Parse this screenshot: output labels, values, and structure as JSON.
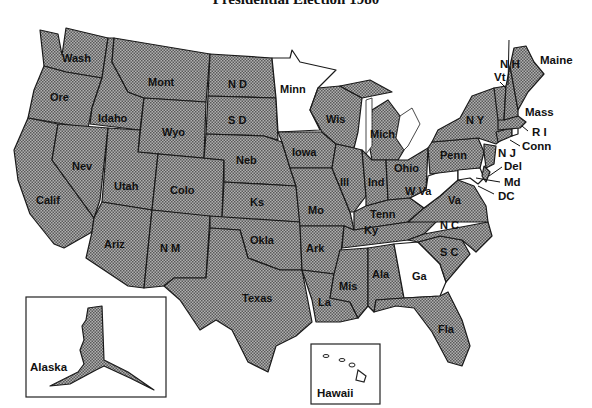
{
  "title": "Presidential Election 1980",
  "colors": {
    "reagan_fill": "#8a8a8a",
    "carter_fill": "#ffffff",
    "border": "#1a1a1a",
    "background": "#ffffff"
  },
  "legend_semantics": {
    "shaded": "Reagan",
    "white": "Carter"
  },
  "states": [
    {
      "abbr": "Wash",
      "won": "shaded"
    },
    {
      "abbr": "Ore",
      "won": "shaded"
    },
    {
      "abbr": "Calif",
      "won": "shaded"
    },
    {
      "abbr": "Idaho",
      "won": "shaded"
    },
    {
      "abbr": "Nev",
      "won": "shaded"
    },
    {
      "abbr": "Mont",
      "won": "shaded"
    },
    {
      "abbr": "Wyo",
      "won": "shaded"
    },
    {
      "abbr": "Utah",
      "won": "shaded"
    },
    {
      "abbr": "Colo",
      "won": "shaded"
    },
    {
      "abbr": "Ariz",
      "won": "shaded"
    },
    {
      "abbr": "N M",
      "won": "shaded"
    },
    {
      "abbr": "N D",
      "won": "shaded"
    },
    {
      "abbr": "S D",
      "won": "shaded"
    },
    {
      "abbr": "Neb",
      "won": "shaded"
    },
    {
      "abbr": "Ks",
      "won": "shaded"
    },
    {
      "abbr": "Okla",
      "won": "shaded"
    },
    {
      "abbr": "Texas",
      "won": "shaded"
    },
    {
      "abbr": "Minn",
      "won": "white"
    },
    {
      "abbr": "Iowa",
      "won": "shaded"
    },
    {
      "abbr": "Mo",
      "won": "shaded"
    },
    {
      "abbr": "Ark",
      "won": "shaded"
    },
    {
      "abbr": "La",
      "won": "shaded"
    },
    {
      "abbr": "Wis",
      "won": "shaded"
    },
    {
      "abbr": "Ill",
      "won": "shaded"
    },
    {
      "abbr": "Mich",
      "won": "shaded"
    },
    {
      "abbr": "Ind",
      "won": "shaded"
    },
    {
      "abbr": "Ohio",
      "won": "shaded"
    },
    {
      "abbr": "Ky",
      "won": "shaded"
    },
    {
      "abbr": "Tenn",
      "won": "shaded"
    },
    {
      "abbr": "Mis",
      "won": "shaded"
    },
    {
      "abbr": "Ala",
      "won": "shaded"
    },
    {
      "abbr": "Ga",
      "won": "white"
    },
    {
      "abbr": "Fla",
      "won": "shaded"
    },
    {
      "abbr": "S C",
      "won": "shaded"
    },
    {
      "abbr": "N C",
      "won": "shaded"
    },
    {
      "abbr": "Va",
      "won": "shaded"
    },
    {
      "abbr": "W Va",
      "won": "white"
    },
    {
      "abbr": "Penn",
      "won": "shaded"
    },
    {
      "abbr": "N Y",
      "won": "shaded"
    },
    {
      "abbr": "Vt",
      "won": "shaded"
    },
    {
      "abbr": "N H",
      "won": "shaded"
    },
    {
      "abbr": "Maine",
      "won": "shaded"
    },
    {
      "abbr": "Mass",
      "won": "shaded"
    },
    {
      "abbr": "R I",
      "won": "white"
    },
    {
      "abbr": "Conn",
      "won": "shaded"
    },
    {
      "abbr": "N J",
      "won": "shaded"
    },
    {
      "abbr": "Del",
      "won": "shaded"
    },
    {
      "abbr": "Md",
      "won": "white"
    },
    {
      "abbr": "DC",
      "won": "white"
    },
    {
      "abbr": "Alaska",
      "won": "shaded"
    },
    {
      "abbr": "Hawaii",
      "won": "white"
    }
  ],
  "labels": {
    "wash": "Wash",
    "ore": "Ore",
    "calif": "Calif",
    "idaho": "Idaho",
    "nev": "Nev",
    "mont": "Mont",
    "wyo": "Wyo",
    "utah": "Utah",
    "colo": "Colo",
    "ariz": "Ariz",
    "nm": "N M",
    "nd": "N D",
    "sd": "S D",
    "neb": "Neb",
    "ks": "Ks",
    "okla": "Okla",
    "texas": "Texas",
    "minn": "Minn",
    "iowa": "Iowa",
    "mo": "Mo",
    "ark": "Ark",
    "la": "La",
    "wis": "Wis",
    "ill": "Ill",
    "mich": "Mich",
    "ind": "Ind",
    "ohio": "Ohio",
    "ky": "Ky",
    "tenn": "Tenn",
    "mis": "Mis",
    "ala": "Ala",
    "ga": "Ga",
    "fla": "Fla",
    "sc": "S C",
    "nc": "N C",
    "va": "Va",
    "wva": "W Va",
    "penn": "Penn",
    "ny": "N Y",
    "vt": "Vt",
    "nh": "N H",
    "maine": "Maine",
    "mass": "Mass",
    "ri": "R I",
    "conn": "Conn",
    "nj": "N J",
    "del": "Del",
    "md": "Md",
    "dc": "DC",
    "alaska": "Alaska",
    "hawaii": "Hawaii"
  }
}
